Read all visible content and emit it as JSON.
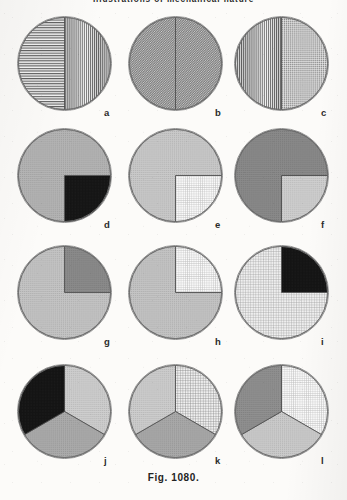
{
  "page": {
    "running_head": "Illustrations of mechanical nature",
    "caption": "Fig.  1080.",
    "background_color": "#fcfbf9"
  },
  "figure": {
    "id": "Fig. 1080",
    "columns": 3,
    "rows": 4,
    "total_circles": 12
  },
  "chart_data": {
    "type": "pie",
    "title": "Fig.  1080.",
    "subtitle": "Illustrations of mechanical nature",
    "xlabel": "",
    "ylabel": "",
    "legend_position": "none",
    "grid": false,
    "note": "Twelve shading-pattern discs arranged in a 3x4 grid; each disc is divided into sectors of equal or proportional size rendered with different hatch/tone fills.",
    "charts": [
      {
        "label": "a",
        "row": 1,
        "column": 1,
        "slices": [
          {
            "name": "upper half",
            "value": 50,
            "start_deg": 270,
            "end_deg": 90,
            "fill": "vertical-lines",
            "color": "#9a9a9a"
          },
          {
            "name": "lower half",
            "value": 50,
            "start_deg": 90,
            "end_deg": 270,
            "fill": "horizontal-lines",
            "color": "#9a9a9a"
          }
        ]
      },
      {
        "label": "b",
        "row": 1,
        "column": 2,
        "slices": [
          {
            "name": "upper half",
            "value": 50,
            "start_deg": 270,
            "end_deg": 90,
            "fill": "diagonal-fine",
            "color": "#9d9d9d"
          },
          {
            "name": "lower half",
            "value": 50,
            "start_deg": 90,
            "end_deg": 270,
            "fill": "diagonal-fine",
            "color": "#9d9d9d"
          }
        ]
      },
      {
        "label": "c",
        "row": 1,
        "column": 3,
        "slices": [
          {
            "name": "upper half",
            "value": 50,
            "start_deg": 270,
            "end_deg": 90,
            "fill": "dotted-fine",
            "color": "#9d9d9d"
          },
          {
            "name": "lower half",
            "value": 50,
            "start_deg": 90,
            "end_deg": 270,
            "fill": "vertical-lines",
            "color": "#8f8f8f"
          }
        ]
      },
      {
        "label": "d",
        "row": 2,
        "column": 1,
        "slices": [
          {
            "name": "upper-right quarter",
            "value": 25,
            "start_deg": 0,
            "end_deg": 90,
            "fill": "solid-black",
            "color": "#151515"
          },
          {
            "name": "remaining three quarters",
            "value": 75,
            "start_deg": 90,
            "end_deg": 360,
            "fill": "mid-tone",
            "color": "#b4b4b4"
          }
        ]
      },
      {
        "label": "e",
        "row": 2,
        "column": 2,
        "slices": [
          {
            "name": "upper-right quarter",
            "value": 25,
            "start_deg": 0,
            "end_deg": 90,
            "fill": "very-light-grid",
            "color": "#ececec"
          },
          {
            "name": "remaining three quarters",
            "value": 75,
            "start_deg": 90,
            "end_deg": 360,
            "fill": "light-tone",
            "color": "#c9c9c9"
          }
        ]
      },
      {
        "label": "f",
        "row": 2,
        "column": 3,
        "slices": [
          {
            "name": "upper-right quarter",
            "value": 25,
            "start_deg": 0,
            "end_deg": 90,
            "fill": "light-tone",
            "color": "#cfcfcf"
          },
          {
            "name": "remaining three quarters",
            "value": 75,
            "start_deg": 90,
            "end_deg": 360,
            "fill": "dark-tone",
            "color": "#8a8a8a"
          }
        ]
      },
      {
        "label": "g",
        "row": 3,
        "column": 1,
        "slices": [
          {
            "name": "lower-right quarter",
            "value": 25,
            "start_deg": 270,
            "end_deg": 360,
            "fill": "dark-tone",
            "color": "#8b8b8b"
          },
          {
            "name": "remaining three quarters",
            "value": 75,
            "start_deg": 0,
            "end_deg": 270,
            "fill": "light-tone",
            "color": "#c4c4c4"
          }
        ]
      },
      {
        "label": "h",
        "row": 3,
        "column": 2,
        "slices": [
          {
            "name": "lower-right quarter",
            "value": 25,
            "start_deg": 270,
            "end_deg": 360,
            "fill": "very-light-grid",
            "color": "#dcdcdc"
          },
          {
            "name": "remaining three quarters",
            "value": 75,
            "start_deg": 0,
            "end_deg": 270,
            "fill": "light-tone",
            "color": "#c4c4c4"
          }
        ]
      },
      {
        "label": "i",
        "row": 3,
        "column": 3,
        "slices": [
          {
            "name": "lower-right quarter",
            "value": 25,
            "start_deg": 270,
            "end_deg": 360,
            "fill": "solid-black",
            "color": "#141414"
          },
          {
            "name": "remaining three quarters",
            "value": 75,
            "start_deg": 0,
            "end_deg": 270,
            "fill": "light-grid",
            "color": "#c9c9c9"
          }
        ]
      },
      {
        "label": "j",
        "row": 4,
        "column": 1,
        "slices": [
          {
            "name": "upper-right third",
            "value": 33.3,
            "start_deg": 270,
            "end_deg": 30,
            "fill": "light-tone",
            "color": "#cecece"
          },
          {
            "name": "lower-right third",
            "value": 33.3,
            "start_deg": 30,
            "end_deg": 150,
            "fill": "mid-tone",
            "color": "#ababab"
          },
          {
            "name": "left third",
            "value": 33.3,
            "start_deg": 150,
            "end_deg": 270,
            "fill": "solid-black",
            "color": "#141414"
          }
        ]
      },
      {
        "label": "k",
        "row": 4,
        "column": 2,
        "slices": [
          {
            "name": "upper-right third",
            "value": 33.3,
            "start_deg": 270,
            "end_deg": 30,
            "fill": "checker-grid",
            "color": "#bdbdbd"
          },
          {
            "name": "lower-right third",
            "value": 33.3,
            "start_deg": 30,
            "end_deg": 150,
            "fill": "mid-tone",
            "color": "#a9a9a9"
          },
          {
            "name": "left third",
            "value": 33.3,
            "start_deg": 150,
            "end_deg": 270,
            "fill": "light-tone",
            "color": "#cdcdcd"
          }
        ]
      },
      {
        "label": "l",
        "row": 4,
        "column": 3,
        "slices": [
          {
            "name": "upper-right third",
            "value": 33.3,
            "start_deg": 270,
            "end_deg": 30,
            "fill": "very-light-grid",
            "color": "#e6e6e6"
          },
          {
            "name": "lower-right third",
            "value": 33.3,
            "start_deg": 30,
            "end_deg": 150,
            "fill": "light-tone",
            "color": "#cbcbcb"
          },
          {
            "name": "left third",
            "value": 33.3,
            "start_deg": 150,
            "end_deg": 270,
            "fill": "dark-tone",
            "color": "#909090"
          }
        ]
      }
    ]
  }
}
